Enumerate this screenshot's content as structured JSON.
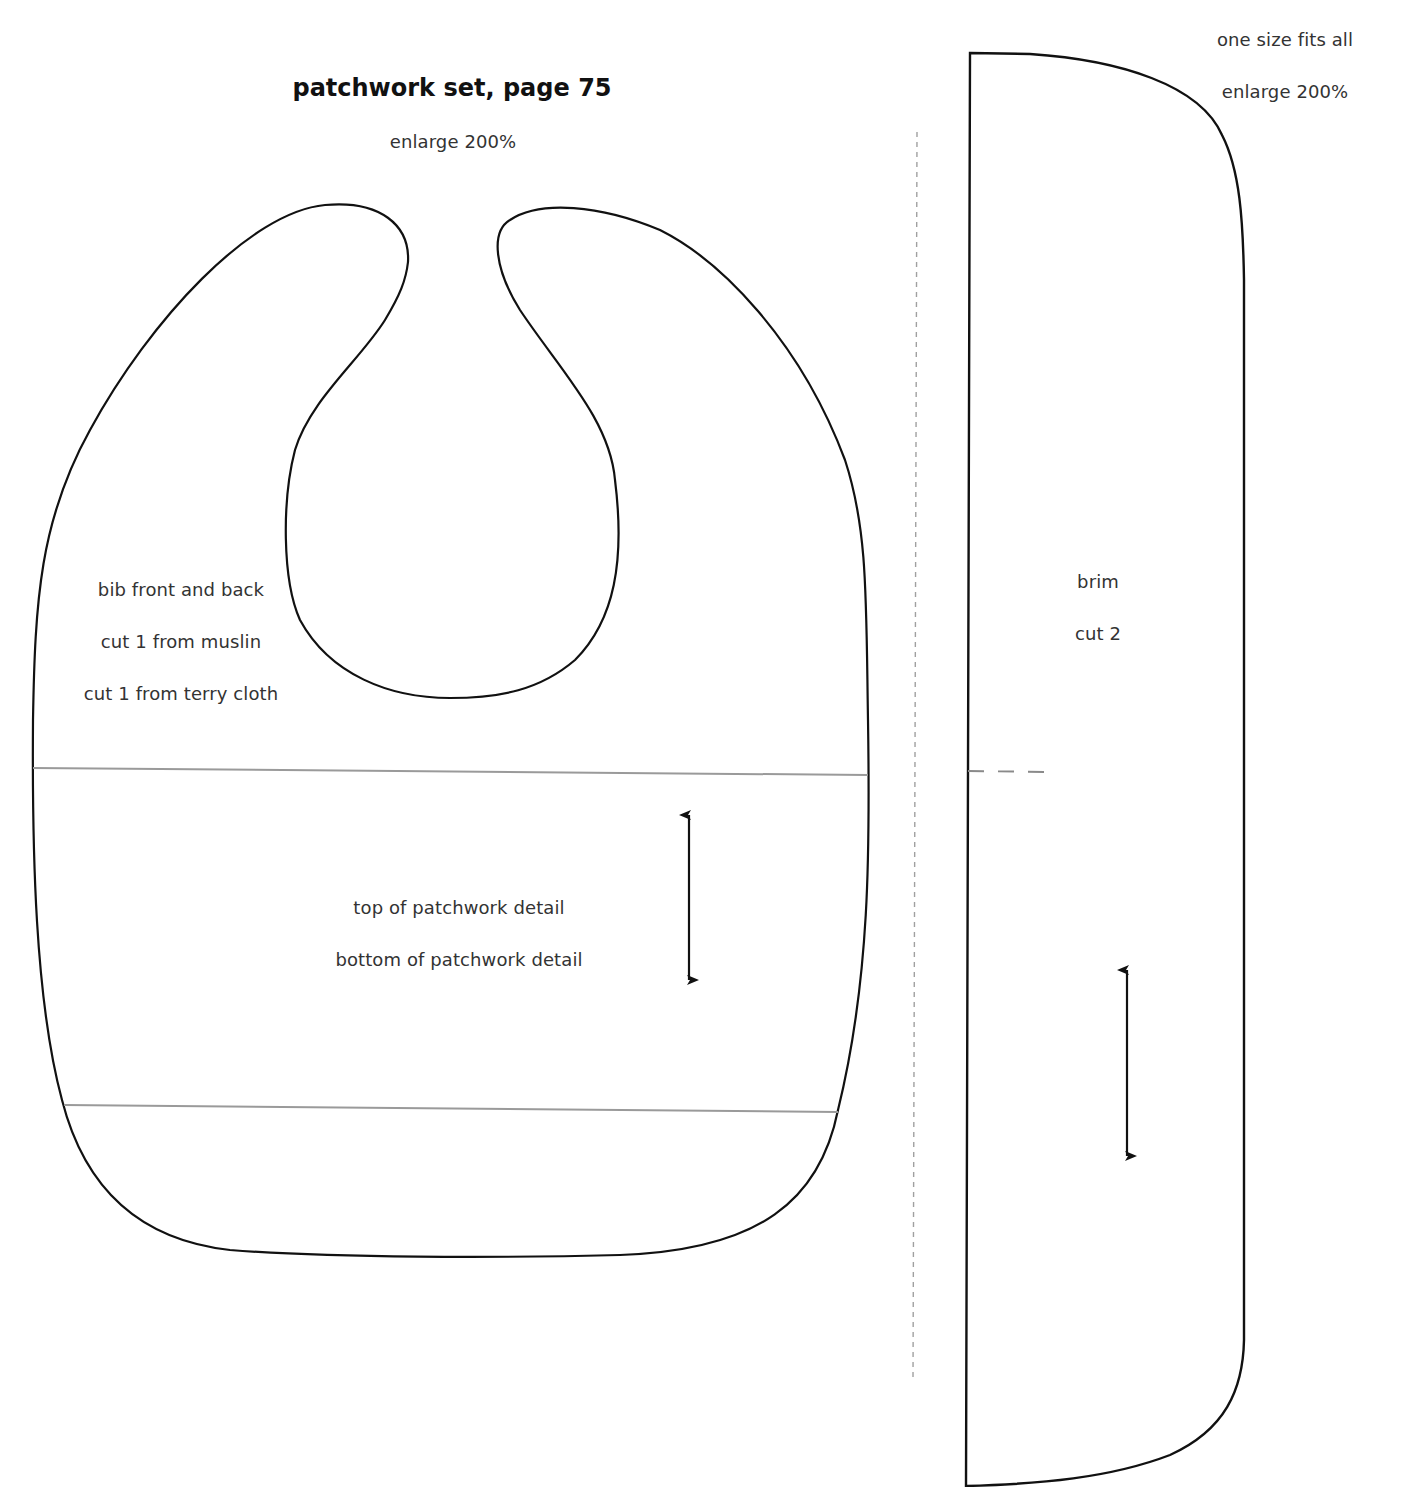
{
  "header": {
    "title": "patchwork set, page 75",
    "subtitle": "enlarge 200%"
  },
  "bib_piece": {
    "label": "bib front and back",
    "cut_lines": [
      "cut 1 from muslin",
      "cut 1 from terry cloth"
    ],
    "patchwork_top_label": "top of patchwork detail",
    "patchwork_bottom_label": "bottom of patchwork detail",
    "grainline_icon": "double-arrow-icon"
  },
  "brim_piece": {
    "size_note": "one size fits all",
    "enlarge_note": "enlarge 200%",
    "label": "brim",
    "cut_note": "cut 2",
    "grainline_icon": "double-arrow-icon"
  },
  "colors": {
    "outline": "#111111",
    "guide_line": "#9a9a9a",
    "fold_line": "#a0a0a0",
    "text": "#333333"
  }
}
